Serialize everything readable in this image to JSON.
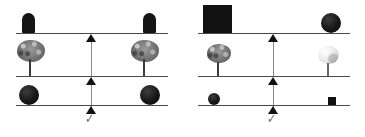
{
  "figure": {
    "background_color": "#ffffff",
    "beam_color": "#4a4a4a",
    "fulcrum_color": "#111111",
    "post_color": "#8a8a8a",
    "check_color": "#6b6b6b",
    "check_glyph": "✓",
    "panel_count": 2
  },
  "panels": [
    {
      "id": "left",
      "name": "balanced-scale-panel",
      "rows": [
        {
          "name": "top-beam-row",
          "left_object": {
            "label": "dome",
            "icon": "dome-shape",
            "color": "#151515",
            "size": "large"
          },
          "right_object": {
            "label": "dome",
            "icon": "dome-shape",
            "color": "#151515",
            "size": "large"
          }
        },
        {
          "name": "middle-beam-row",
          "left_object": {
            "label": "tree",
            "icon": "tree-icon",
            "color": "#6f6f6f",
            "size": "large"
          },
          "right_object": {
            "label": "tree",
            "icon": "tree-icon",
            "color": "#6f6f6f",
            "size": "large"
          }
        },
        {
          "name": "bottom-beam-row",
          "left_object": {
            "label": "sphere",
            "icon": "sphere-shape",
            "color": "#161616",
            "size": "large"
          },
          "right_object": {
            "label": "sphere",
            "icon": "sphere-shape",
            "color": "#161616",
            "size": "large"
          }
        }
      ],
      "marker": {
        "label": "check",
        "icon": "check-icon",
        "glyph": "✓"
      }
    },
    {
      "id": "right",
      "name": "unbalanced-scale-panel",
      "rows": [
        {
          "name": "top-beam-row",
          "left_object": {
            "label": "cube",
            "icon": "cube-shape",
            "color": "#111111",
            "size": "large"
          },
          "right_object": {
            "label": "sphere",
            "icon": "sphere-shape",
            "color": "#161616",
            "size": "large"
          }
        },
        {
          "name": "middle-beam-row",
          "left_object": {
            "label": "dark tree",
            "icon": "tree-icon",
            "color": "#6f6f6f",
            "size": "medium"
          },
          "right_object": {
            "label": "light tree",
            "icon": "tree-icon",
            "color": "#ececec",
            "size": "medium"
          }
        },
        {
          "name": "bottom-beam-row",
          "left_object": {
            "label": "sphere",
            "icon": "sphere-shape",
            "color": "#161616",
            "size": "small"
          },
          "right_object": {
            "label": "cube",
            "icon": "cube-shape",
            "color": "#111111",
            "size": "small"
          }
        }
      ],
      "marker": {
        "label": "check",
        "icon": "check-icon",
        "glyph": "✓"
      }
    }
  ]
}
